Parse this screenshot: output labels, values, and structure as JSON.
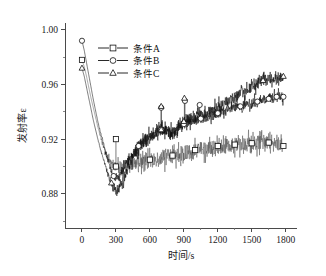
{
  "chart_data": {
    "type": "line",
    "title": "",
    "xlabel": "时间/s",
    "ylabel": "发射率ε",
    "xlim": [
      -150,
      1900
    ],
    "ylim": [
      0.855,
      1.005
    ],
    "xticks": [
      0,
      300,
      600,
      900,
      1200,
      1500,
      1800
    ],
    "xticklabels": [
      "0",
      "300",
      "600",
      "900",
      "1200",
      "1500",
      "1800"
    ],
    "yticks": [
      0.88,
      0.92,
      0.96,
      1.0
    ],
    "yticklabels": [
      "0.88",
      "0.92",
      "0.96",
      "1.00"
    ],
    "yminorticks": [
      0.86,
      0.9,
      0.94,
      0.98
    ],
    "grid": false,
    "legend_position": "upper-center-left",
    "legend": [
      "条件A",
      "条件B",
      "条件C"
    ],
    "markers": [
      "square",
      "circle",
      "triangle"
    ],
    "series": [
      {
        "name": "条件A",
        "marker": "square",
        "x": [
          0,
          20,
          40,
          60,
          80,
          100,
          120,
          140,
          160,
          180,
          200,
          220,
          240,
          260,
          280,
          300,
          320,
          340,
          360,
          380,
          400,
          420,
          440,
          460,
          480,
          500,
          520,
          540,
          560,
          580,
          600,
          620,
          640,
          660,
          680,
          700,
          720,
          740,
          760,
          780,
          800,
          820,
          840,
          860,
          880,
          900,
          920,
          940,
          960,
          980,
          1000,
          1020,
          1040,
          1060,
          1080,
          1100,
          1120,
          1140,
          1160,
          1180,
          1200,
          1220,
          1240,
          1260,
          1280,
          1300,
          1320,
          1340,
          1360,
          1380,
          1400,
          1420,
          1440,
          1460,
          1480,
          1500,
          1520,
          1540,
          1560,
          1580,
          1600,
          1620,
          1640,
          1660,
          1680,
          1700,
          1720,
          1740,
          1760,
          1780
        ],
        "y": [
          0.978,
          0.973,
          0.966,
          0.958,
          0.95,
          0.943,
          0.936,
          0.929,
          0.923,
          0.917,
          0.912,
          0.908,
          0.905,
          0.902,
          0.901,
          0.9,
          0.899,
          0.9,
          0.899,
          0.9,
          0.901,
          0.9,
          0.902,
          0.901,
          0.903,
          0.902,
          0.904,
          0.903,
          0.905,
          0.904,
          0.905,
          0.904,
          0.906,
          0.905,
          0.907,
          0.906,
          0.907,
          0.906,
          0.908,
          0.907,
          0.908,
          0.907,
          0.909,
          0.908,
          0.91,
          0.909,
          0.911,
          0.91,
          0.911,
          0.91,
          0.912,
          0.911,
          0.913,
          0.912,
          0.913,
          0.912,
          0.914,
          0.913,
          0.914,
          0.913,
          0.915,
          0.914,
          0.915,
          0.914,
          0.916,
          0.915,
          0.916,
          0.915,
          0.917,
          0.916,
          0.917,
          0.916,
          0.917,
          0.916,
          0.918,
          0.917,
          0.918,
          0.917,
          0.918,
          0.917,
          0.918,
          0.917,
          0.918,
          0.917,
          0.918,
          0.917,
          0.918,
          0.916,
          0.917,
          0.915
        ],
        "marker_x": [
          0,
          300,
          600,
          800,
          1000,
          1200,
          1350,
          1500,
          1650,
          1780
        ],
        "noise": 0.0055,
        "spikes": [
          [
            300,
            0.92
          ]
        ]
      },
      {
        "name": "条件B",
        "marker": "circle",
        "x": [
          0,
          20,
          40,
          60,
          80,
          100,
          120,
          140,
          160,
          180,
          200,
          220,
          240,
          260,
          280,
          300,
          320,
          340,
          360,
          380,
          400,
          420,
          440,
          460,
          480,
          500,
          520,
          540,
          560,
          580,
          600,
          620,
          640,
          660,
          680,
          700,
          720,
          740,
          760,
          780,
          800,
          820,
          840,
          860,
          880,
          900,
          920,
          940,
          960,
          980,
          1000,
          1020,
          1040,
          1060,
          1080,
          1100,
          1120,
          1140,
          1160,
          1180,
          1200,
          1220,
          1240,
          1260,
          1280,
          1300,
          1320,
          1340,
          1360,
          1380,
          1400,
          1420,
          1440,
          1460,
          1480,
          1500,
          1520,
          1540,
          1560,
          1580,
          1600,
          1620,
          1640,
          1660,
          1680,
          1700,
          1720,
          1740,
          1760,
          1780
        ],
        "y": [
          0.992,
          0.985,
          0.976,
          0.967,
          0.958,
          0.949,
          0.941,
          0.933,
          0.926,
          0.92,
          0.913,
          0.907,
          0.901,
          0.896,
          0.893,
          0.891,
          0.892,
          0.894,
          0.897,
          0.9,
          0.903,
          0.906,
          0.908,
          0.911,
          0.913,
          0.915,
          0.917,
          0.919,
          0.92,
          0.921,
          0.922,
          0.923,
          0.924,
          0.925,
          0.926,
          0.927,
          0.927,
          0.926,
          0.925,
          0.924,
          0.924,
          0.925,
          0.927,
          0.929,
          0.93,
          0.931,
          0.932,
          0.932,
          0.933,
          0.933,
          0.934,
          0.934,
          0.935,
          0.935,
          0.936,
          0.936,
          0.937,
          0.937,
          0.938,
          0.938,
          0.939,
          0.939,
          0.94,
          0.94,
          0.941,
          0.941,
          0.942,
          0.942,
          0.943,
          0.943,
          0.944,
          0.944,
          0.945,
          0.945,
          0.946,
          0.946,
          0.947,
          0.947,
          0.948,
          0.948,
          0.949,
          0.949,
          0.949,
          0.95,
          0.95,
          0.95,
          0.951,
          0.951,
          0.951,
          0.951
        ],
        "marker_x": [
          0,
          280,
          500,
          700,
          900,
          1050,
          1200,
          1400,
          1550,
          1650,
          1720,
          1780
        ],
        "noise": 0.0035,
        "spikes": [
          [
            700,
            0.943
          ],
          [
            910,
            0.948
          ],
          [
            1040,
            0.945
          ]
        ]
      },
      {
        "name": "条件C",
        "marker": "triangle",
        "x": [
          0,
          20,
          40,
          60,
          80,
          100,
          120,
          140,
          160,
          180,
          200,
          220,
          240,
          260,
          280,
          300,
          320,
          340,
          360,
          380,
          400,
          420,
          440,
          460,
          480,
          500,
          520,
          540,
          560,
          580,
          600,
          620,
          640,
          660,
          680,
          700,
          720,
          740,
          760,
          780,
          800,
          820,
          840,
          860,
          880,
          900,
          920,
          940,
          960,
          980,
          1000,
          1020,
          1040,
          1060,
          1080,
          1100,
          1120,
          1140,
          1160,
          1180,
          1200,
          1220,
          1240,
          1260,
          1280,
          1300,
          1320,
          1340,
          1360,
          1380,
          1400,
          1420,
          1440,
          1460,
          1480,
          1500,
          1520,
          1540,
          1560,
          1580,
          1600,
          1620,
          1640,
          1660,
          1680,
          1700,
          1720,
          1740,
          1760,
          1780
        ],
        "y": [
          0.972,
          0.966,
          0.958,
          0.95,
          0.942,
          0.934,
          0.927,
          0.92,
          0.914,
          0.908,
          0.902,
          0.897,
          0.892,
          0.888,
          0.884,
          0.882,
          0.883,
          0.886,
          0.89,
          0.894,
          0.898,
          0.902,
          0.905,
          0.908,
          0.911,
          0.914,
          0.916,
          0.918,
          0.92,
          0.921,
          0.922,
          0.923,
          0.924,
          0.925,
          0.926,
          0.927,
          0.927,
          0.927,
          0.926,
          0.926,
          0.926,
          0.927,
          0.929,
          0.93,
          0.932,
          0.933,
          0.934,
          0.934,
          0.935,
          0.935,
          0.936,
          0.936,
          0.937,
          0.937,
          0.938,
          0.939,
          0.94,
          0.941,
          0.941,
          0.942,
          0.943,
          0.944,
          0.945,
          0.946,
          0.947,
          0.948,
          0.949,
          0.95,
          0.951,
          0.952,
          0.953,
          0.954,
          0.955,
          0.956,
          0.957,
          0.958,
          0.959,
          0.96,
          0.961,
          0.962,
          0.963,
          0.963,
          0.964,
          0.964,
          0.964,
          0.965,
          0.965,
          0.965,
          0.966,
          0.966
        ],
        "marker_x": [
          0,
          260,
          700,
          900,
          1600,
          1780
        ],
        "noise": 0.0042,
        "spikes": [
          [
            700,
            0.944
          ],
          [
            905,
            0.95
          ]
        ]
      }
    ]
  }
}
